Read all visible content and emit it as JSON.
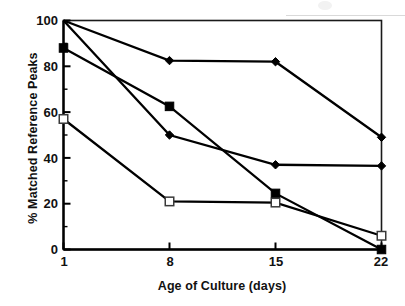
{
  "chart_data": {
    "type": "line",
    "title": "",
    "xlabel": "Age of Culture (days)",
    "ylabel": "% Matched Reference Peaks",
    "x": [
      1,
      8,
      15,
      22
    ],
    "xtick_labels": [
      "1",
      "8",
      "15",
      "22"
    ],
    "ytick_labels": [
      "0",
      "20",
      "40",
      "60",
      "80",
      "100"
    ],
    "ytick_values": [
      0,
      20,
      40,
      60,
      80,
      100
    ],
    "yminor_values": [
      10,
      30,
      50,
      70,
      90
    ],
    "ylim": [
      0,
      100
    ],
    "grid": false,
    "legend": "none",
    "frame": "full-box",
    "series": [
      {
        "name": "series-1-diamond-upper",
        "marker": "filled-diamond",
        "color": "#000000",
        "values": [
          100,
          82.5,
          82,
          49
        ]
      },
      {
        "name": "series-2-diamond-lower",
        "marker": "filled-diamond",
        "color": "#000000",
        "values": [
          100,
          50,
          37,
          36.5
        ]
      },
      {
        "name": "series-3-filled-square",
        "marker": "filled-square",
        "color": "#000000",
        "values": [
          88,
          62.5,
          24.5,
          0
        ]
      },
      {
        "name": "series-4-open-square",
        "marker": "open-square",
        "color": "#000000",
        "values": [
          57,
          21,
          20.5,
          6
        ]
      }
    ]
  },
  "axis": {
    "ytick_0": "0",
    "ytick_20": "20",
    "ytick_40": "40",
    "ytick_60": "60",
    "ytick_80": "80",
    "ytick_100": "100",
    "xtick_1": "1",
    "xtick_8": "8",
    "xtick_15": "15",
    "xtick_22": "22"
  }
}
